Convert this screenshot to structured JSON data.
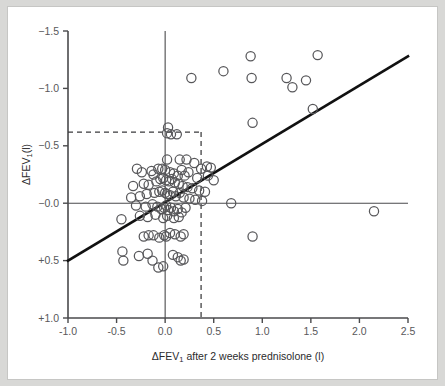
{
  "figure": {
    "background_color": "#ffffff",
    "frame_color": "#c6c6c4",
    "page_color": "#d8d8d6"
  },
  "chart_data": {
    "type": "scatter",
    "title": "",
    "subtitle": "",
    "xlabel": "ΔFEV₁ after 2 weeks prednisolone (l)",
    "xlabel_main": "ΔFEV",
    "xlabel_sub": "1",
    "xlabel_tail": " after 2 weeks prednisolone (l)",
    "ylabel": "ΔFEV₁(l)",
    "ylabel_main": "ΔFEV",
    "ylabel_sub": "1",
    "ylabel_tail": "(l)",
    "xlim": [
      -1.0,
      2.5
    ],
    "ylim": [
      1.0,
      -1.5
    ],
    "y_axis_inverted": true,
    "grid": false,
    "legend": null,
    "xticks": [
      -1.0,
      -0.5,
      0.0,
      0.5,
      1.0,
      1.5,
      2.0,
      2.5
    ],
    "xticklabels": [
      "-1.0",
      "-0.5",
      "0.0",
      "0.5",
      "1.0",
      "1.5",
      "2.0",
      "2.5"
    ],
    "yticks": [
      -1.5,
      -1.0,
      -0.5,
      0.0,
      0.5,
      1.0
    ],
    "yticklabels": [
      "−1.5",
      "−1.0",
      "−0.5",
      "−0.0",
      "+0.5",
      "+1.0"
    ],
    "marker": "open-circle",
    "marker_color": "#57575a",
    "marker_size": 4.6,
    "reference_lines": [
      {
        "name": "zero-horizontal",
        "orientation": "horizontal",
        "value": 0.0,
        "style": "solid"
      },
      {
        "name": "zero-vertical",
        "orientation": "vertical",
        "value": 0.0,
        "style": "solid"
      }
    ],
    "dashed_threshold_lines": [
      {
        "name": "y-threshold",
        "orientation": "horizontal",
        "value": -0.62,
        "x_from": -1.0,
        "x_to": 0.37,
        "style": "dashed"
      },
      {
        "name": "x-threshold",
        "orientation": "vertical",
        "value": 0.37,
        "y_from": -0.62,
        "y_to": 1.0,
        "style": "dashed"
      }
    ],
    "fit_line": {
      "name": "regression-line",
      "type": "linear",
      "x1": -1.0,
      "y1": 0.5,
      "x2": 2.5,
      "y2": -1.28,
      "slope": -0.508,
      "intercept": -0.008,
      "color": "#111111"
    },
    "n_points": 95,
    "points": [
      [
        0.88,
        -1.28
      ],
      [
        1.57,
        -1.29
      ],
      [
        0.6,
        -1.15
      ],
      [
        1.45,
        -1.07
      ],
      [
        1.31,
        -1.01
      ],
      [
        1.25,
        -1.09
      ],
      [
        0.89,
        -1.09
      ],
      [
        0.27,
        -1.09
      ],
      [
        1.52,
        -0.82
      ],
      [
        0.9,
        -0.7
      ],
      [
        0.03,
        -0.66
      ],
      [
        0.06,
        -0.6
      ],
      [
        0.12,
        -0.6
      ],
      [
        0.02,
        -0.61
      ],
      [
        0.02,
        -0.38
      ],
      [
        0.15,
        -0.38
      ],
      [
        0.22,
        -0.38
      ],
      [
        0.3,
        -0.35
      ],
      [
        0.43,
        -0.32
      ],
      [
        0.47,
        -0.31
      ],
      [
        0.37,
        -0.3
      ],
      [
        0.17,
        -0.29
      ],
      [
        0.24,
        -0.27
      ],
      [
        -0.29,
        -0.3
      ],
      [
        -0.24,
        -0.27
      ],
      [
        -0.14,
        -0.28
      ],
      [
        -0.12,
        -0.25
      ],
      [
        -0.07,
        -0.3
      ],
      [
        -0.03,
        -0.3
      ],
      [
        0.0,
        -0.29
      ],
      [
        0.05,
        -0.27
      ],
      [
        0.09,
        -0.26
      ],
      [
        0.13,
        -0.24
      ],
      [
        0.2,
        -0.24
      ],
      [
        0.33,
        -0.22
      ],
      [
        0.44,
        -0.24
      ],
      [
        0.5,
        -0.2
      ],
      [
        -0.33,
        -0.15
      ],
      [
        -0.22,
        -0.17
      ],
      [
        -0.17,
        -0.16
      ],
      [
        -0.09,
        -0.19
      ],
      [
        -0.05,
        -0.21
      ],
      [
        -0.02,
        -0.22
      ],
      [
        0.01,
        -0.2
      ],
      [
        0.04,
        -0.19
      ],
      [
        0.07,
        -0.21
      ],
      [
        0.1,
        -0.18
      ],
      [
        0.14,
        -0.17
      ],
      [
        0.18,
        -0.15
      ],
      [
        0.23,
        -0.14
      ],
      [
        0.28,
        -0.13
      ],
      [
        0.35,
        -0.11
      ],
      [
        0.41,
        -0.1
      ],
      [
        -0.35,
        -0.05
      ],
      [
        -0.26,
        -0.06
      ],
      [
        -0.19,
        -0.08
      ],
      [
        -0.11,
        -0.09
      ],
      [
        -0.06,
        -0.1
      ],
      [
        -0.03,
        -0.11
      ],
      [
        0.0,
        -0.09
      ],
      [
        0.02,
        -0.08
      ],
      [
        0.05,
        -0.07
      ],
      [
        0.08,
        -0.1
      ],
      [
        0.11,
        -0.06
      ],
      [
        0.15,
        -0.09
      ],
      [
        0.19,
        -0.05
      ],
      [
        0.25,
        -0.04
      ],
      [
        0.31,
        -0.03
      ],
      [
        0.38,
        -0.02
      ],
      [
        -0.3,
        0.02
      ],
      [
        -0.2,
        0.03
      ],
      [
        -0.13,
        0.01
      ],
      [
        -0.08,
        0.03
      ],
      [
        -0.04,
        0.05
      ],
      [
        -0.01,
        0.04
      ],
      [
        0.01,
        0.02
      ],
      [
        0.03,
        0.06
      ],
      [
        0.06,
        0.04
      ],
      [
        0.09,
        0.07
      ],
      [
        0.13,
        0.05
      ],
      [
        0.17,
        0.08
      ],
      [
        0.21,
        0.04
      ],
      [
        0.68,
        0.0
      ],
      [
        2.15,
        0.07
      ],
      [
        -0.45,
        0.14
      ],
      [
        -0.26,
        0.11
      ],
      [
        -0.18,
        0.12
      ],
      [
        -0.1,
        0.1
      ],
      [
        -0.02,
        0.13
      ],
      [
        0.02,
        0.11
      ],
      [
        0.09,
        0.13
      ],
      [
        0.14,
        0.12
      ],
      [
        -0.01,
        0.28
      ],
      [
        0.01,
        0.29
      ],
      [
        0.05,
        0.26
      ],
      [
        0.1,
        0.27
      ],
      [
        0.16,
        0.29
      ],
      [
        0.19,
        0.27
      ],
      [
        -0.22,
        0.29
      ],
      [
        -0.17,
        0.28
      ],
      [
        -0.12,
        0.28
      ],
      [
        -0.06,
        0.3
      ],
      [
        0.9,
        0.29
      ],
      [
        -0.44,
        0.42
      ],
      [
        -0.43,
        0.5
      ],
      [
        -0.27,
        0.46
      ],
      [
        -0.18,
        0.44
      ],
      [
        -0.13,
        0.5
      ],
      [
        -0.07,
        0.56
      ],
      [
        -0.02,
        0.55
      ],
      [
        0.08,
        0.45
      ],
      [
        0.13,
        0.47
      ],
      [
        0.16,
        0.5
      ],
      [
        0.19,
        0.49
      ]
    ]
  }
}
